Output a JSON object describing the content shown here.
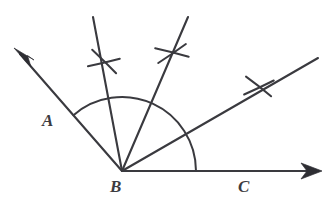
{
  "figure": {
    "type": "geometric-construction-diagram",
    "width": 334,
    "height": 216,
    "background_color": "#ffffff",
    "ink_color": "#3a3a3f"
  },
  "labels": [
    {
      "id": "A",
      "text": "A",
      "x": 42,
      "y": 112,
      "describes": "label-for-ray-endpoint-a"
    },
    {
      "id": "B",
      "text": "B",
      "x": 110,
      "y": 178,
      "describes": "label-for-vertex-b"
    },
    {
      "id": "C",
      "text": "C",
      "x": 238,
      "y": 178,
      "describes": "label-for-ray-endpoint-c"
    }
  ],
  "vertex": {
    "name": "B",
    "x": 122,
    "y": 171
  },
  "rays": [
    {
      "name": "ray-ba",
      "from": [
        122,
        171
      ],
      "to": [
        16,
        50
      ],
      "angle_degrees": 131,
      "arrowhead": true,
      "arrow_at": "to"
    },
    {
      "name": "ray-construction-left",
      "from": [
        122,
        171
      ],
      "to": [
        93,
        17
      ],
      "angle_degrees": 79,
      "arrowhead": false
    },
    {
      "name": "ray-construction-middle",
      "from": [
        122,
        171
      ],
      "to": [
        188,
        17
      ],
      "angle_degrees": 67,
      "arrowhead": false
    },
    {
      "name": "ray-bd-bisector",
      "from": [
        122,
        171
      ],
      "to": [
        318,
        58
      ],
      "angle_degrees": 30,
      "arrowhead": false
    },
    {
      "name": "ray-bc",
      "from": [
        122,
        171
      ],
      "to": [
        322,
        171
      ],
      "angle_degrees": 0,
      "arrowhead": true,
      "arrow_at": "to"
    }
  ],
  "arcs": [
    {
      "name": "main-compass-arc",
      "center": [
        122,
        171
      ],
      "radius": 74,
      "start_angle_degrees": 131,
      "end_angle_degrees": 0
    }
  ],
  "cross_marks": [
    {
      "name": "cross-mark-left",
      "x": 104,
      "y": 62,
      "size": 15,
      "rotation_degrees": 18
    },
    {
      "name": "cross-mark-middle",
      "x": 172,
      "y": 53,
      "size": 15,
      "rotation_degrees": -8
    },
    {
      "name": "cross-mark-right",
      "x": 259,
      "y": 87,
      "size": 15,
      "rotation_degrees": 6
    }
  ],
  "arrowheads": [
    {
      "name": "arrowhead-a",
      "tip": [
        14,
        48
      ],
      "angle_degrees": 131,
      "length": 17,
      "halfwidth": 6
    },
    {
      "name": "arrowhead-c",
      "tip": [
        322,
        171
      ],
      "angle_degrees": 0,
      "length": 17,
      "halfwidth": 6
    }
  ]
}
